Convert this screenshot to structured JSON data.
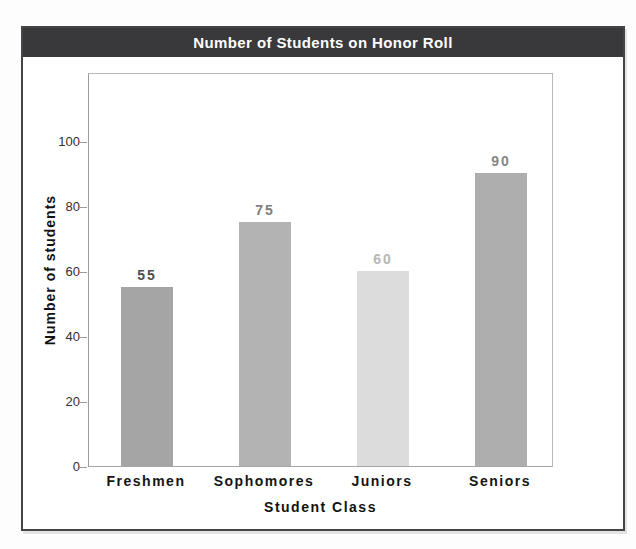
{
  "window": {
    "background_color": "#fdfdfd",
    "frame_border_color": "#454547"
  },
  "header": {
    "background_color": "#39393b",
    "text_color": "#ffffff"
  },
  "chart_data": {
    "type": "bar",
    "title": "Number of Students on Honor Roll",
    "categories": [
      "Freshmen",
      "Sophomores",
      "Juniors",
      "Seniors"
    ],
    "values": [
      55,
      75,
      60,
      90
    ],
    "value_labels": [
      "55",
      "75",
      "60",
      "90"
    ],
    "xlabel": "Student Class",
    "ylabel": "Number of students",
    "yticks": [
      "0",
      "20",
      "40",
      "60",
      "80",
      "100"
    ],
    "ytick_values": [
      0,
      20,
      40,
      60,
      80,
      100
    ],
    "ylim": [
      0,
      120
    ],
    "grid": false,
    "legend": false,
    "bar_colors": [
      "#a5a5a5",
      "#b3b3b3",
      "#dcdcdc",
      "#aeaeae"
    ],
    "value_label_colors": [
      "#4f4f4f",
      "#7e7e7e",
      "#b7b7b7",
      "#868686"
    ],
    "tick_label_color": "#2f2f2f",
    "category_label_color": "#141414",
    "axis_color": "#9b9b9b"
  }
}
